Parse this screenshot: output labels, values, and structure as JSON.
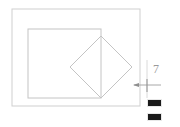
{
  "app": {
    "title": "technical-drawing-view",
    "background_color": "#ffffff"
  },
  "drawing": {
    "line_color": "#c9c9c9",
    "line_color_dark": "#b0b0b0",
    "outer_frame": {
      "name": "outer-rectangle",
      "x": 12,
      "y": 9,
      "width": 128,
      "height": 97
    },
    "inner_frame": {
      "name": "inner-rectangle",
      "x": 28,
      "y": 29,
      "width": 73,
      "height": 69
    },
    "diamond": {
      "name": "rotated-square",
      "top": {
        "x": 101,
        "y": 36
      },
      "right": {
        "x": 132,
        "y": 67
      },
      "bottom": {
        "x": 101,
        "y": 98
      },
      "left": {
        "x": 70,
        "y": 67
      }
    },
    "vertical_guide": {
      "name": "vertical-guide-line",
      "x": 147,
      "y1": 60,
      "y2": 98
    }
  },
  "annotation": {
    "dimension_label": "7",
    "label_color": "#9a9a9a",
    "leader_line": {
      "name": "dimension-leader",
      "x1": 134,
      "y1": 85,
      "x2": 160,
      "y2": 85
    },
    "arrow_head": {
      "name": "arrow-head-left",
      "x": 134,
      "y": 85
    },
    "tick_mark": {
      "name": "crosshair-tick",
      "x": 147,
      "y1": 79,
      "y2": 92
    }
  },
  "swatches": [
    {
      "name": "color-swatch-top",
      "label": "",
      "color": "#1a1a1a"
    },
    {
      "name": "color-swatch-bottom",
      "label": "",
      "color": "#1a1a1a"
    }
  ]
}
